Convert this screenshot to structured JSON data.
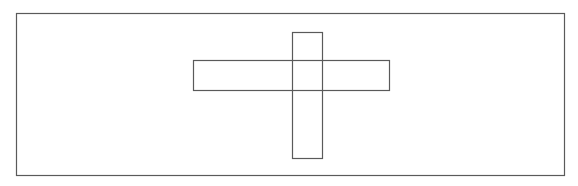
{
  "diagram": {
    "background": "#ffffff",
    "stroke_color": "#5a5a5a",
    "stroke_width": 1.2,
    "shapes": [
      {
        "id": "outer-frame",
        "type": "rect",
        "x": 16,
        "y": 13,
        "width": 548,
        "height": 162
      },
      {
        "id": "horizontal-bar",
        "type": "rect",
        "x": 193,
        "y": 60,
        "width": 196,
        "height": 30
      },
      {
        "id": "vertical-bar",
        "type": "rect",
        "x": 292,
        "y": 32,
        "width": 30,
        "height": 126
      }
    ]
  }
}
